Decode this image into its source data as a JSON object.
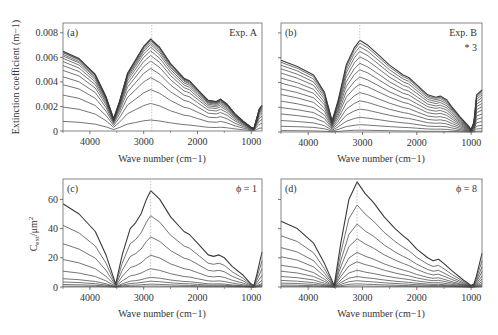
{
  "chart_data": [
    {
      "panel": "(a)",
      "type": "line",
      "annotation": "Exp. A",
      "xlabel": "Wave number (cm−1)",
      "ylabel": "Extinction coefficient (m−1)",
      "xlim": [
        4500,
        800
      ],
      "ylim": [
        0,
        0.0088
      ],
      "xticks": [
        4000,
        3000,
        2000,
        1000
      ],
      "yticks": [
        0,
        0.002,
        0.004,
        0.006,
        0.008
      ],
      "ytick_labels": [
        "0",
        "0.002",
        "0.004",
        "0.006",
        "0.008"
      ],
      "dotted_line_x": 2850,
      "x": [
        4500,
        4200,
        3900,
        3700,
        3560,
        3450,
        3300,
        3150,
        3000,
        2870,
        2700,
        2500,
        2250,
        2150,
        2000,
        1800,
        1650,
        1570,
        1450,
        1300,
        1150,
        1000,
        950,
        900,
        850,
        800
      ],
      "peak_profile": [
        0.0065,
        0.0059,
        0.0046,
        0.0028,
        0.001,
        0.0024,
        0.0047,
        0.0058,
        0.0069,
        0.0075,
        0.0068,
        0.0055,
        0.0043,
        0.0041,
        0.0034,
        0.0025,
        0.0024,
        0.0026,
        0.0022,
        0.0014,
        0.0008,
        0.0003,
        0.0002,
        0.001,
        0.0018,
        0.0021
      ],
      "series_scales": [
        0.12,
        0.3,
        0.45,
        0.58,
        0.68,
        0.76,
        0.82,
        0.87,
        0.91,
        0.94,
        0.96,
        0.98,
        0.99,
        1.0
      ],
      "grid": false
    },
    {
      "panel": "(b)",
      "type": "line",
      "annotation": "Exp. B",
      "annotation2": "* 3",
      "xlabel": "Wave number (cm−1)",
      "xlim": [
        4500,
        800
      ],
      "ylim": [
        0,
        0.0088
      ],
      "xticks": [
        4000,
        3000,
        2000,
        1000
      ],
      "yticks": [
        0,
        0.002,
        0.004,
        0.006,
        0.008
      ],
      "dotted_line_x": 3050,
      "x": [
        4500,
        4200,
        3900,
        3700,
        3560,
        3450,
        3300,
        3150,
        3050,
        2900,
        2700,
        2500,
        2250,
        2150,
        2000,
        1800,
        1650,
        1570,
        1450,
        1350,
        1200,
        1050,
        1000,
        950,
        900,
        800
      ],
      "peak_profile": [
        0.0058,
        0.0053,
        0.0046,
        0.0032,
        0.0009,
        0.0025,
        0.0054,
        0.0068,
        0.0074,
        0.007,
        0.0062,
        0.0054,
        0.0046,
        0.0044,
        0.0038,
        0.003,
        0.0028,
        0.0029,
        0.0026,
        0.002,
        0.0012,
        0.0005,
        0.0002,
        0.0008,
        0.003,
        0.0034
      ],
      "series_scales": [
        0.02,
        0.08,
        0.16,
        0.25,
        0.34,
        0.43,
        0.52,
        0.6,
        0.68,
        0.75,
        0.82,
        0.88,
        0.93,
        0.97,
        1.0
      ],
      "grid": false
    },
    {
      "panel": "(c)",
      "type": "line",
      "annotation": "ϕ = 1",
      "xlabel": "Wave number (cm−1)",
      "ylabel": "C_ext/μm²",
      "xlim": [
        4500,
        800
      ],
      "ylim": [
        0,
        74
      ],
      "xticks": [
        4000,
        3000,
        2000,
        1000
      ],
      "yticks": [
        0,
        20,
        40,
        60
      ],
      "ytick_labels": [
        "0",
        "20",
        "40",
        "60"
      ],
      "dotted_line_x": 2870,
      "x": [
        4500,
        4200,
        3900,
        3700,
        3520,
        3400,
        3250,
        3150,
        3050,
        2950,
        2870,
        2700,
        2500,
        2250,
        2150,
        2000,
        1800,
        1700,
        1600,
        1500,
        1350,
        1150,
        1000,
        950,
        900,
        800
      ],
      "peak_profile": [
        57,
        50,
        38,
        22,
        2,
        22,
        40,
        44,
        50,
        60,
        66,
        60,
        48,
        38,
        36,
        30,
        22,
        21,
        22,
        20,
        14,
        8,
        2,
        1,
        8,
        24
      ],
      "series_scales": [
        0.01,
        0.03,
        0.06,
        0.1,
        0.19,
        0.33,
        0.52,
        0.74,
        1.0
      ],
      "grid": false
    },
    {
      "panel": "(d)",
      "type": "line",
      "annotation": "ϕ = 8",
      "xlabel": "Wave number (cm−1)",
      "xlim": [
        4500,
        800
      ],
      "ylim": [
        0,
        74
      ],
      "xticks": [
        4000,
        3000,
        2000,
        1000
      ],
      "yticks": [
        0,
        20,
        40,
        60
      ],
      "dotted_line_x": 3100,
      "x": [
        4500,
        4200,
        3900,
        3700,
        3520,
        3400,
        3250,
        3100,
        2950,
        2800,
        2600,
        2400,
        2250,
        2150,
        2000,
        1800,
        1700,
        1600,
        1500,
        1350,
        1150,
        1000,
        950,
        900,
        800
      ],
      "peak_profile": [
        45,
        40,
        30,
        16,
        1,
        30,
        60,
        72,
        64,
        58,
        48,
        40,
        35,
        32,
        26,
        20,
        18,
        19,
        16,
        11,
        5,
        1,
        2,
        8,
        23
      ],
      "series_scales": [
        0.01,
        0.03,
        0.06,
        0.1,
        0.16,
        0.24,
        0.33,
        0.46,
        0.6,
        0.78,
        1.0
      ],
      "grid": false
    }
  ],
  "panels": [
    {
      "label": "(a)",
      "annotation": "Exp. A",
      "annotation2": "",
      "xlabel": "Wave number (cm−1)",
      "ylabel": "Extinction coefficient (m−1)"
    },
    {
      "label": "(b)",
      "annotation": "Exp. B",
      "annotation2": "* 3",
      "xlabel": "Wave number (cm−1)",
      "ylabel": ""
    },
    {
      "label": "(c)",
      "annotation": "ϕ = 1",
      "annotation2": "",
      "xlabel": "Wave number (cm−1)",
      "ylabel": "C_ext/μm²"
    },
    {
      "label": "(d)",
      "annotation": "ϕ = 8",
      "annotation2": "",
      "xlabel": "Wave number (cm−1)",
      "ylabel": ""
    }
  ],
  "xtick_labels": [
    "4000",
    "3000",
    "2000",
    "1000"
  ],
  "colors": {
    "line": "#3a3a3a",
    "axis": "#555555",
    "dotted": "#aaaaaa"
  }
}
